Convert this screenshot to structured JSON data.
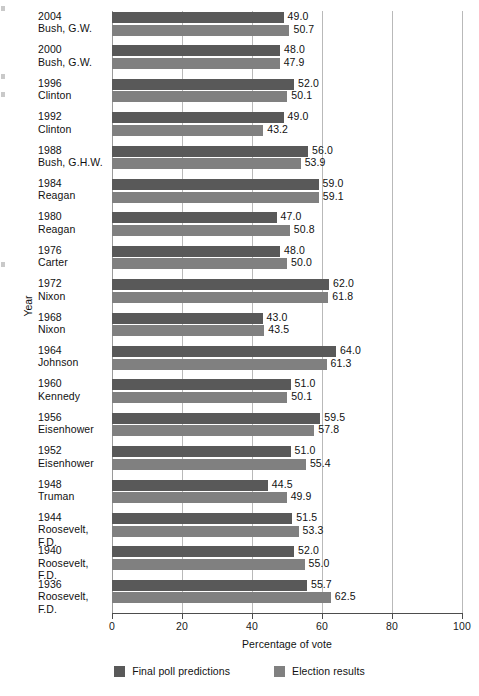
{
  "chart_data": {
    "type": "bar",
    "orientation": "horizontal",
    "title": "",
    "xlabel": "Percentage of vote",
    "ylabel": "Year",
    "xlim": [
      0,
      100
    ],
    "xticks": [
      0,
      20,
      40,
      60,
      80,
      100
    ],
    "grid": true,
    "legend_position": "bottom",
    "categories": [
      {
        "year": "2004",
        "name": "Bush, G.W."
      },
      {
        "year": "2000",
        "name": "Bush, G.W."
      },
      {
        "year": "1996",
        "name": "Clinton"
      },
      {
        "year": "1992",
        "name": "Clinton"
      },
      {
        "year": "1988",
        "name": "Bush, G.H.W."
      },
      {
        "year": "1984",
        "name": "Reagan"
      },
      {
        "year": "1980",
        "name": "Reagan"
      },
      {
        "year": "1976",
        "name": "Carter"
      },
      {
        "year": "1972",
        "name": "Nixon"
      },
      {
        "year": "1968",
        "name": "Nixon"
      },
      {
        "year": "1964",
        "name": "Johnson"
      },
      {
        "year": "1960",
        "name": "Kennedy"
      },
      {
        "year": "1956",
        "name": "Eisenhower"
      },
      {
        "year": "1952",
        "name": "Eisenhower"
      },
      {
        "year": "1948",
        "name": "Truman"
      },
      {
        "year": "1944",
        "name": "Roosevelt, F.D."
      },
      {
        "year": "1940",
        "name": "Roosevelt, F.D."
      },
      {
        "year": "1936",
        "name": "Roosevelt, F.D."
      }
    ],
    "series": [
      {
        "name": "Final poll predictions",
        "color": "#595959",
        "values": [
          49.0,
          48.0,
          52.0,
          49.0,
          56.0,
          59.0,
          47.0,
          48.0,
          62.0,
          43.0,
          64.0,
          51.0,
          59.5,
          51.0,
          44.5,
          51.5,
          52.0,
          55.7
        ]
      },
      {
        "name": "Election results",
        "color": "#808080",
        "values": [
          50.7,
          47.9,
          50.1,
          43.2,
          53.9,
          59.1,
          50.8,
          50.0,
          61.8,
          43.5,
          61.3,
          50.1,
          57.8,
          55.4,
          49.9,
          53.3,
          55.0,
          62.5
        ]
      }
    ]
  },
  "legend": {
    "items": [
      {
        "label": "Final poll predictions",
        "swatch": "pred"
      },
      {
        "label": "Election results",
        "swatch": "res"
      }
    ]
  }
}
